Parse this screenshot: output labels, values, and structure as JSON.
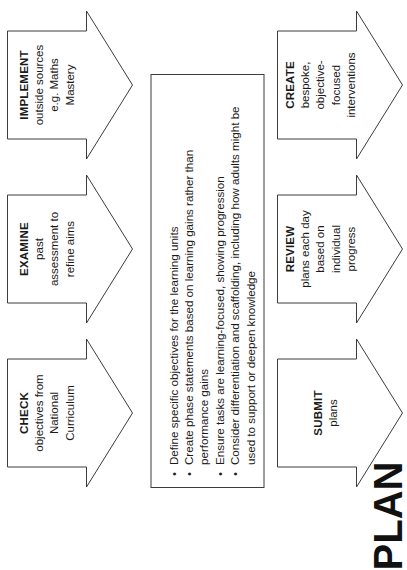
{
  "acronym": {
    "letters": [
      "P",
      "L",
      "A",
      "N"
    ]
  },
  "top_row": [
    {
      "id": "check",
      "title": "CHECK",
      "lines": [
        "objectives from",
        "National",
        "Curriculum"
      ]
    },
    {
      "id": "examine",
      "title": "EXAMINE",
      "lines": [
        "past",
        "assessment to",
        "refine aims"
      ]
    },
    {
      "id": "implement",
      "title": "IMPLEMENT",
      "lines": [
        "outside sources",
        "e.g. Maths",
        "Mastery"
      ]
    }
  ],
  "center_panel": {
    "bullets": [
      "Define specific objectives for the learning units",
      "Create phase statements based on learning gains rather than performance gains",
      "Ensure tasks are learning-focused, showing progression",
      "Consider differentiation and scaffolding, including how adults might be used to support or deepen knowledge"
    ]
  },
  "bottom_row": [
    {
      "id": "submit",
      "title": "SUBMIT",
      "lines": [
        "plans"
      ]
    },
    {
      "id": "review",
      "title": "REVIEW",
      "lines": [
        "plans each day",
        "based on",
        "individual",
        "progress"
      ]
    },
    {
      "id": "create",
      "title": "CREATE",
      "lines": [
        "bespoke,",
        "objective-",
        "focused",
        "interventions"
      ]
    }
  ],
  "colors": {
    "outline": "#3c3c3c",
    "text": "#1a1a1a",
    "background": "#ffffff"
  }
}
